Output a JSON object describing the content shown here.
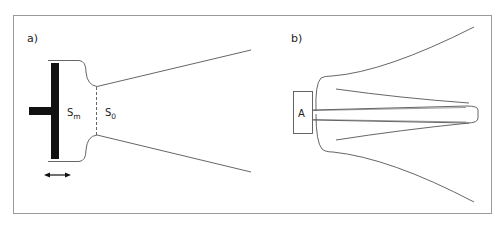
{
  "figure": {
    "panels": [
      {
        "label": "a)",
        "annotations": {
          "chamber_area": "S",
          "chamber_area_sub": "m",
          "throat_area": "S",
          "throat_area_sub": "0"
        },
        "elements": [
          "piston",
          "compression-chamber",
          "throat-dashed-line",
          "conical-horn",
          "double-arrow"
        ]
      },
      {
        "label": "b)",
        "annotations": {
          "driver_label": "A"
        },
        "elements": [
          "driver-box",
          "outer-flare",
          "inner-phase-plug"
        ]
      }
    ],
    "colors": {
      "line": "#555555",
      "fill_dark": "#111111",
      "frame": "#999999",
      "text": "#222222"
    }
  }
}
